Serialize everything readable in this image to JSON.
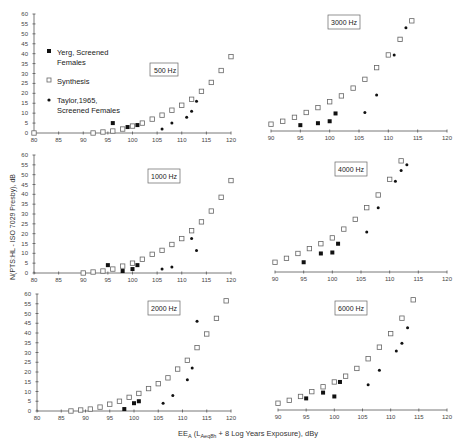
{
  "chart_data": [
    {
      "type": "scatter",
      "title": "500 Hz",
      "xlim": [
        80,
        120
      ],
      "ylim": [
        0,
        60
      ],
      "xticks": [
        80,
        85,
        90,
        95,
        100,
        105,
        110,
        115,
        120
      ],
      "yticks": [
        0,
        5,
        10,
        15,
        20,
        25,
        30,
        35,
        40,
        45,
        50,
        55,
        60
      ],
      "series": [
        {
          "name": "Yerg, Screened Females",
          "marker": "filled-square",
          "points": [
            [
              96,
              5
            ],
            [
              99,
              3
            ],
            [
              101,
              4
            ]
          ]
        },
        {
          "name": "Synthesis",
          "marker": "open-square",
          "points": [
            [
              80,
              0
            ],
            [
              92,
              0
            ],
            [
              94,
              0.5
            ],
            [
              96,
              1
            ],
            [
              98,
              2
            ],
            [
              100,
              3.5
            ],
            [
              102,
              5
            ],
            [
              104,
              7
            ],
            [
              106,
              9
            ],
            [
              108,
              11.5
            ],
            [
              110,
              14
            ],
            [
              112,
              17
            ],
            [
              114,
              21
            ],
            [
              116,
              25.5
            ],
            [
              118,
              31.5
            ],
            [
              120,
              38.5
            ]
          ]
        },
        {
          "name": "Taylor,1965, Screened Females",
          "marker": "dot",
          "points": [
            [
              106,
              2
            ],
            [
              108,
              5
            ],
            [
              111,
              8
            ],
            [
              112,
              11
            ],
            [
              113,
              16
            ]
          ]
        }
      ]
    },
    {
      "type": "scatter",
      "title": "3000 Hz",
      "xlim": [
        90,
        120
      ],
      "ylim": [
        0,
        60
      ],
      "xticks": [
        90,
        95,
        100,
        105,
        110,
        115,
        120
      ],
      "series": [
        {
          "name": "Yerg, Screened Females",
          "marker": "filled-square",
          "points": [
            [
              95,
              3
            ],
            [
              98,
              4
            ],
            [
              100,
              5
            ],
            [
              101,
              9
            ],
            [
              112,
              47
            ]
          ]
        },
        {
          "name": "Synthesis",
          "marker": "open-square",
          "points": [
            [
              90,
              3.5
            ],
            [
              92,
              5
            ],
            [
              94,
              7
            ],
            [
              96,
              9.5
            ],
            [
              98,
              12
            ],
            [
              100,
              15
            ],
            [
              102,
              18
            ],
            [
              104,
              22
            ],
            [
              106,
              26.5
            ],
            [
              108,
              32.5
            ],
            [
              110,
              39
            ],
            [
              112,
              47
            ],
            [
              114,
              56.5
            ]
          ]
        },
        {
          "name": "Taylor,1965, Screened Females",
          "marker": "dot",
          "points": [
            [
              106,
              9.5
            ],
            [
              108,
              18.5
            ],
            [
              111,
              39
            ],
            [
              113,
              53
            ]
          ]
        }
      ]
    },
    {
      "type": "scatter",
      "title": "1000 Hz",
      "xlim": [
        80,
        120
      ],
      "ylim": [
        0,
        60
      ],
      "xticks": [
        80,
        85,
        90,
        95,
        100,
        105,
        110,
        115,
        120
      ],
      "yticks": [
        0,
        5,
        10,
        15,
        20,
        25,
        30,
        35,
        40,
        45,
        50,
        55,
        60
      ],
      "series": [
        {
          "name": "Yerg, Screened Females",
          "marker": "filled-square",
          "points": [
            [
              95,
              4
            ],
            [
              98,
              1
            ],
            [
              100,
              2
            ],
            [
              101,
              4
            ]
          ]
        },
        {
          "name": "Synthesis",
          "marker": "open-square",
          "points": [
            [
              90,
              0
            ],
            [
              92,
              0.5
            ],
            [
              94,
              1
            ],
            [
              96,
              2
            ],
            [
              98,
              3.5
            ],
            [
              100,
              5
            ],
            [
              102,
              7
            ],
            [
              104,
              9.5
            ],
            [
              106,
              11.5
            ],
            [
              108,
              14.5
            ],
            [
              110,
              17.5
            ],
            [
              112,
              21.5
            ],
            [
              114,
              26
            ],
            [
              116,
              31.5
            ],
            [
              118,
              38.5
            ],
            [
              120,
              47
            ]
          ]
        },
        {
          "name": "Taylor,1965, Screened Females",
          "marker": "dot",
          "points": [
            [
              106,
              2
            ],
            [
              108,
              3
            ],
            [
              112,
              17.5
            ],
            [
              113,
              11.5
            ]
          ]
        }
      ]
    },
    {
      "type": "scatter",
      "title": "4000 Hz",
      "xlim": [
        90,
        120
      ],
      "ylim": [
        0,
        60
      ],
      "xticks": [
        90,
        95,
        100,
        105,
        110,
        115,
        120
      ],
      "series": [
        {
          "name": "Yerg, Screened Females",
          "marker": "filled-square",
          "points": [
            [
              95,
              5
            ],
            [
              98,
              9.5
            ],
            [
              100,
              10
            ],
            [
              101,
              14.5
            ]
          ]
        },
        {
          "name": "Synthesis",
          "marker": "open-square",
          "points": [
            [
              90,
              5
            ],
            [
              92,
              7
            ],
            [
              94,
              9.5
            ],
            [
              96,
              12
            ],
            [
              98,
              14.5
            ],
            [
              100,
              17.5
            ],
            [
              102,
              22
            ],
            [
              104,
              27
            ],
            [
              106,
              33
            ],
            [
              108,
              39.5
            ],
            [
              110,
              47.5
            ],
            [
              112,
              57
            ]
          ]
        },
        {
          "name": "Taylor,1965, Screened Females",
          "marker": "dot",
          "points": [
            [
              106,
              20.5
            ],
            [
              108,
              33
            ],
            [
              111,
              46.5
            ],
            [
              112,
              52
            ],
            [
              113,
              55
            ]
          ]
        }
      ]
    },
    {
      "type": "scatter",
      "title": "2000 Hz",
      "xlim": [
        80,
        120
      ],
      "ylim": [
        0,
        60
      ],
      "xticks": [
        80,
        85,
        90,
        95,
        100,
        105,
        110,
        115,
        120
      ],
      "yticks": [
        0,
        5,
        10,
        15,
        20,
        25,
        30,
        35,
        40,
        45,
        50,
        55,
        60
      ],
      "series": [
        {
          "name": "Yerg, Screened Females",
          "marker": "filled-square",
          "points": [
            [
              98,
              1
            ],
            [
              100,
              4
            ],
            [
              101,
              5
            ]
          ]
        },
        {
          "name": "Synthesis",
          "marker": "open-square",
          "points": [
            [
              87,
              0
            ],
            [
              89,
              0.5
            ],
            [
              91,
              1
            ],
            [
              93,
              2
            ],
            [
              95,
              3.5
            ],
            [
              97,
              5
            ],
            [
              99,
              7
            ],
            [
              101,
              9
            ],
            [
              103,
              11.5
            ],
            [
              105,
              14
            ],
            [
              107,
              17
            ],
            [
              109,
              21.5
            ],
            [
              111,
              26
            ],
            [
              113,
              32.5
            ],
            [
              115,
              39.5
            ],
            [
              117,
              47.5
            ],
            [
              119,
              56.5
            ]
          ]
        },
        {
          "name": "Taylor,1965, Screened Females",
          "marker": "dot",
          "points": [
            [
              106,
              4
            ],
            [
              108,
              8
            ],
            [
              111,
              16
            ],
            [
              112,
              22
            ],
            [
              113,
              46
            ]
          ]
        }
      ]
    },
    {
      "type": "scatter",
      "title": "6000 Hz",
      "xlim": [
        90,
        120
      ],
      "ylim": [
        0,
        60
      ],
      "xticks": [
        90,
        95,
        100,
        105,
        110,
        115,
        120
      ],
      "series": [
        {
          "name": "Yerg, Screened Females",
          "marker": "filled-square",
          "points": [
            [
              95,
              6
            ],
            [
              98,
              9
            ],
            [
              100,
              7
            ],
            [
              101,
              14.5
            ]
          ]
        },
        {
          "name": "Synthesis",
          "marker": "open-square",
          "points": [
            [
              90,
              3.5
            ],
            [
              92,
              5
            ],
            [
              94,
              7
            ],
            [
              96,
              9.5
            ],
            [
              98,
              12
            ],
            [
              100,
              14.5
            ],
            [
              102,
              17.5
            ],
            [
              104,
              21.5
            ],
            [
              106,
              26.5
            ],
            [
              108,
              32.5
            ],
            [
              110,
              39.5
            ],
            [
              112,
              47.5
            ],
            [
              114,
              57
            ]
          ]
        },
        {
          "name": "Taylor,1965, Screened Females",
          "marker": "dot",
          "points": [
            [
              106,
              13
            ],
            [
              108,
              20.5
            ],
            [
              111,
              30.5
            ],
            [
              112,
              34.5
            ],
            [
              113,
              42.5
            ]
          ]
        }
      ]
    }
  ],
  "labels": {
    "y_axis": "N(PTS:HL - ISO 7029 Presby), dB",
    "x_axis_main": "EE",
    "x_axis_sub_a": "A",
    "x_axis_paren": " (L",
    "x_axis_sub_aeq": "Aeq8h",
    "x_axis_rest": " + 8 Log Years Exposure), dBy"
  },
  "legend": {
    "items": [
      {
        "line1": "Yerg,  Screened",
        "line2": "Females",
        "marker": "filled-square"
      },
      {
        "line1": "Synthesis",
        "line2": "",
        "marker": "open-square"
      },
      {
        "line1": "Taylor,1965,",
        "line2": "Screened  Females",
        "marker": "dot"
      }
    ]
  },
  "frequency_labels": {
    "p500": "500  Hz",
    "p3000": "3000  Hz",
    "p1000": "1000  Hz",
    "p4000": "4000  Hz",
    "p2000": "2000  Hz",
    "p6000": "6000  Hz"
  },
  "colors": {
    "filled": "#111111",
    "open_stroke": "#666666",
    "axis": "#555555"
  }
}
